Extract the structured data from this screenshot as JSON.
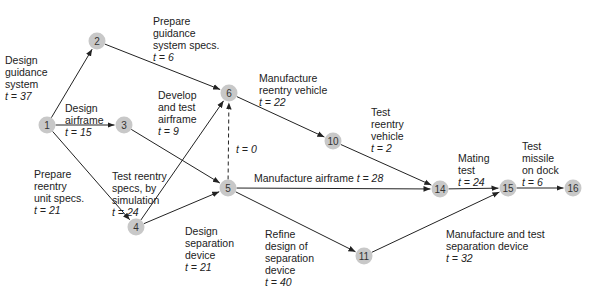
{
  "colors": {
    "node_fill": "#c8c8c8",
    "edge": "#222222",
    "text": "#222222"
  },
  "nodes": [
    {
      "id": "1",
      "x": 47,
      "y": 125
    },
    {
      "id": "2",
      "x": 97,
      "y": 41
    },
    {
      "id": "3",
      "x": 124,
      "y": 125
    },
    {
      "id": "4",
      "x": 136,
      "y": 227
    },
    {
      "id": "5",
      "x": 228,
      "y": 188
    },
    {
      "id": "6",
      "x": 229,
      "y": 93
    },
    {
      "id": "10",
      "x": 333,
      "y": 141
    },
    {
      "id": "11",
      "x": 364,
      "y": 256
    },
    {
      "id": "14",
      "x": 440,
      "y": 189
    },
    {
      "id": "15",
      "x": 508,
      "y": 188
    },
    {
      "id": "16",
      "x": 573,
      "y": 188
    }
  ],
  "edges": [
    {
      "from": "1",
      "to": "2",
      "activity": "Design guidance system",
      "time": "t = 37"
    },
    {
      "from": "1",
      "to": "3",
      "activity": "Design airframe",
      "time": "t = 15"
    },
    {
      "from": "1",
      "to": "4",
      "activity": "Prepare reentry unit specs.",
      "time": "t = 21"
    },
    {
      "from": "2",
      "to": "6",
      "activity": "Prepare guidance system specs.",
      "time": "t = 6"
    },
    {
      "from": "3",
      "to": "5",
      "activity": "Develop and test airframe",
      "time": "t = 9"
    },
    {
      "from": "4",
      "to": "6",
      "activity": "Test reentry specs, by simulation",
      "time": "t = 24"
    },
    {
      "from": "4",
      "to": "5",
      "activity": "Design separation device",
      "time": "t = 21"
    },
    {
      "from": "5",
      "to": "6",
      "activity": "",
      "time": "t = 0",
      "dummy": true
    },
    {
      "from": "6",
      "to": "10",
      "activity": "Manufacture reentry vehicle",
      "time": "t = 22"
    },
    {
      "from": "5",
      "to": "14",
      "activity": "Manufacture airframe",
      "time": "t = 28"
    },
    {
      "from": "5",
      "to": "11",
      "activity": "Refine design of separation device",
      "time": "t = 40"
    },
    {
      "from": "10",
      "to": "14",
      "activity": "Test reentry vehicle",
      "time": "t = 2"
    },
    {
      "from": "11",
      "to": "15",
      "activity": "Manufacture and test separation device",
      "time": "t = 32"
    },
    {
      "from": "14",
      "to": "15",
      "activity": "Mating test",
      "time": "t = 24"
    },
    {
      "from": "15",
      "to": "16",
      "activity": "Test missile on dock",
      "time": "t = 6"
    }
  ],
  "labels": {
    "e1_2": {
      "lines": "Design\nguidance\nsystem",
      "t": "t = 37"
    },
    "e1_3": {
      "lines": "Design\nairframe",
      "t": "t = 15"
    },
    "e1_4": {
      "lines": "Prepare\nreentry\nunit specs.",
      "t": "t = 21"
    },
    "e2_6": {
      "lines": "Prepare\nguidance\nsystem specs.",
      "t": "t = 6"
    },
    "e3_5": {
      "lines": "Develop\nand test\nairframe",
      "t": "t = 9"
    },
    "e4_6": {
      "lines": "Test reentry\nspecs, by\nsimulation",
      "t": "t = 24"
    },
    "e4_5": {
      "lines": "Design\nseparation\ndevice",
      "t": "t = 21"
    },
    "e5_6": {
      "t": "t = 0"
    },
    "e6_10": {
      "lines": "Manufacture\nreentry vehicle",
      "t": "t = 22"
    },
    "e5_14": {
      "lines": "Manufacture airframe ",
      "t": "t = 28"
    },
    "e5_11": {
      "lines": "Refine\ndesign of\nseparation\ndevice",
      "t": "t = 40"
    },
    "e10_14": {
      "lines": "Test\nreentry\nvehicle",
      "t": "t = 2"
    },
    "e11_15": {
      "lines": "Manufacture and test\nseparation device",
      "t": "t = 32"
    },
    "e14_15": {
      "lines": "Mating\ntest",
      "t": "t = 24"
    },
    "e15_16": {
      "lines": "Test\nmissile\non dock",
      "t": "t = 6"
    }
  }
}
